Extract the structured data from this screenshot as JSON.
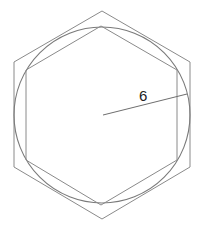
{
  "diagram": {
    "circle": {
      "cx": 102,
      "cy": 115,
      "r": 88
    },
    "outer_hexagon": {
      "points": "102,11 190,62 190,167 102,219 14,167 14,62"
    },
    "inner_hexagon": {
      "points": "101,26 177,70 177,160 101,205 26,160 26,70"
    },
    "radius_line": {
      "x1": 103,
      "y1": 115,
      "x2": 187,
      "y2": 94
    },
    "radius_label": {
      "text": "6",
      "x": 139,
      "y": 101
    },
    "colors": {
      "stroke": "#8a8a8a",
      "label": "#222222",
      "background": "#ffffff"
    }
  }
}
